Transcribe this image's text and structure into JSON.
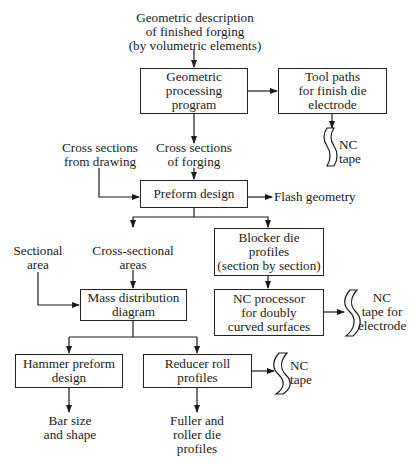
{
  "inputs": {
    "top": "Geometric description\nof finished forging\n(by volumetric elements)",
    "cross_sections_drawing": "Cross sections\nfrom drawing",
    "sectional_area": "Sectional\narea"
  },
  "boxes": {
    "geometric_processing": "Geometric\nprocessing\nprogram",
    "tool_paths": "Tool paths\nfor finish die\nelectrode",
    "preform_design": "Preform design",
    "blocker_die": "Blocker die\nprofiles\n(section by section)",
    "mass_distribution": "Mass distribution\ndiagram",
    "nc_processor": "NC processor\nfor doubly\ncurved surfaces",
    "hammer_preform": "Hammer preform\ndesign",
    "reducer_roll": "Reducer roll\nprofiles"
  },
  "intermediate": {
    "cross_sections_forging": "Cross sections\nof forging",
    "cross_sectional_areas": "Cross-sectional\nareas"
  },
  "outputs": {
    "nc_tape_1": "NC\ntape",
    "flash_geometry": "Flash geometry",
    "nc_tape_electrode": "NC\ntape for\nelectrode",
    "nc_tape_3": "NC\ntape",
    "bar_size": "Bar size\nand shape",
    "fuller_roller": "Fuller and\nroller die\nprofiles"
  }
}
